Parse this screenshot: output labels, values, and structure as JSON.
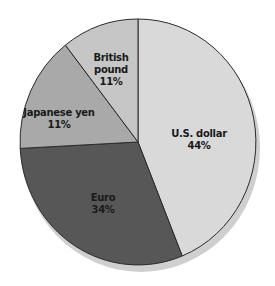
{
  "chart_data": {
    "type": "pie",
    "title": "",
    "slices": [
      {
        "label": "U.S. dollar",
        "value": 44,
        "display": "44%",
        "color": "#d9d9d9"
      },
      {
        "label": "Euro",
        "value": 34,
        "display": "34%",
        "color": "#575757"
      },
      {
        "label": "Japanese yen",
        "value": 11,
        "display": "11%",
        "color": "#a9a9a9"
      },
      {
        "label": "British pound",
        "value": 11,
        "display": "11%",
        "color": "#c6c6c6"
      }
    ],
    "legend": "none (labels inside slices)"
  },
  "labels": {
    "usd": {
      "name": "U.S. dollar",
      "pct": "44%"
    },
    "euro": {
      "name": "Euro",
      "pct": "34%"
    },
    "yen": {
      "name": "Japanese yen",
      "pct": "11%"
    },
    "gbp": {
      "name": "British",
      "name2": "pound",
      "pct": "11%"
    }
  }
}
